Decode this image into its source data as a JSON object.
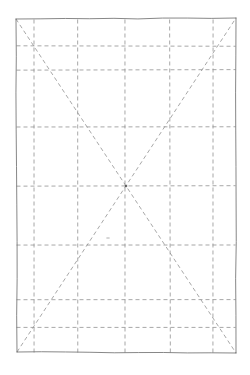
{
  "figure": {
    "title": "Rectangular grid with crossed diagonals",
    "type": "geometric-line-drawing",
    "style": "hand-drawn technical sketch",
    "background_color": "#ffffff",
    "canvas": {
      "width": 250,
      "height": 375
    }
  },
  "chart_data": {
    "type": "line",
    "title": "",
    "xlabel": "",
    "ylabel": "",
    "xlim": [
      15,
      236
    ],
    "ylim": [
      18,
      353
    ],
    "grid": true,
    "legend": null,
    "frame": {
      "name": "outer-rectangle",
      "stroke_color": "#6a6a6a",
      "stroke_width": 0.9,
      "dash": "solid",
      "corners": {
        "top_left": [
          16,
          19
        ],
        "top_right": [
          236,
          18
        ],
        "bottom_right": [
          236,
          353
        ],
        "bottom_left": [
          17,
          352
        ]
      }
    },
    "grid_lines": {
      "stroke_color": "#8c8c8c",
      "stroke_width": 0.8,
      "dash_pattern": [
        4,
        3
      ],
      "vertical_x": [
        34,
        78,
        125,
        170,
        213
      ],
      "horizontal_y": [
        46,
        70,
        127,
        186,
        245,
        300,
        327
      ]
    },
    "diagonals": {
      "stroke_color": "#8c8c8c",
      "stroke_width": 0.8,
      "dash_pattern": [
        4,
        3
      ],
      "series": [
        {
          "name": "diagonal-top-left-to-bottom-right",
          "x": [
            16,
            236
          ],
          "y": [
            19,
            353
          ]
        },
        {
          "name": "diagonal-bottom-left-to-top-right",
          "x": [
            17,
            236
          ],
          "y": [
            352,
            18
          ]
        }
      ],
      "intersection": [
        126,
        186
      ]
    },
    "marks": [
      {
        "name": "center-node",
        "x": 126,
        "y": 186,
        "symbol": "dot"
      },
      {
        "name": "stray-tick",
        "x": 108,
        "y": 238,
        "symbol": "tick"
      }
    ]
  }
}
